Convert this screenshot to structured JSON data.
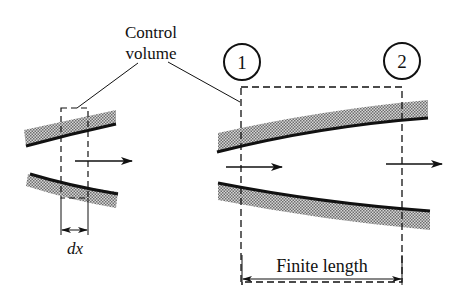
{
  "labels": {
    "control_volume_line1": "Control",
    "control_volume_line2": "volume",
    "station_1": "1",
    "station_2": "2",
    "dx": "dx",
    "finite_length": "Finite length"
  },
  "colors": {
    "ink": "#111111",
    "hatch": "#9a9a9a",
    "background": "#ffffff"
  }
}
